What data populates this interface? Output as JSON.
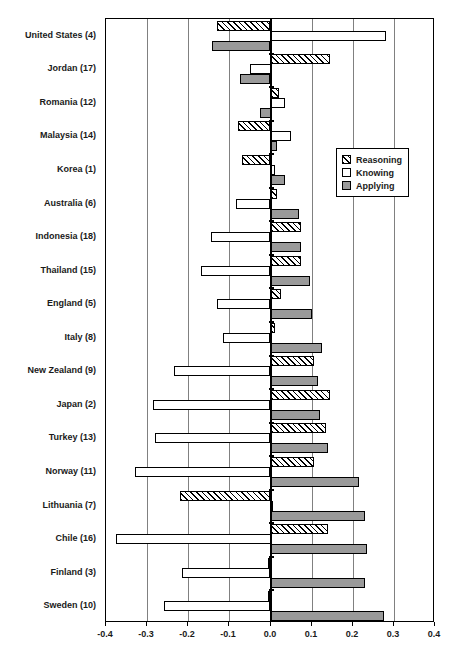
{
  "chart_data": {
    "type": "bar",
    "orientation": "horizontal",
    "title": "",
    "subtitle": "",
    "xlabel": "",
    "ylabel": "",
    "xlim": [
      -0.4,
      0.4
    ],
    "xticks": [
      -0.4,
      -0.3,
      -0.2,
      -0.1,
      0.0,
      0.1,
      0.2,
      0.3,
      0.4
    ],
    "xtick_labels": [
      "-0.4",
      "-0.3",
      "-0.2",
      "-0.1",
      "0.0",
      "0.1",
      "0.2",
      "0.3",
      "0.4"
    ],
    "grid": true,
    "grid_axis": "x",
    "legend_position": "inside-right-upper",
    "categories": [
      "United States (4)",
      "Jordan (17)",
      "Romania (12)",
      "Malaysia (14)",
      "Korea (1)",
      "Australia (6)",
      "Indonesia (18)",
      "Thailand (15)",
      "England (5)",
      "Italy (8)",
      "New Zealand (9)",
      "Japan (2)",
      "Turkey (13)",
      "Norway (11)",
      "Lithuania (7)",
      "Chile (16)",
      "Finland (3)",
      "Sweden (10)"
    ],
    "series": [
      {
        "name": "Reasoning",
        "style": "hatched",
        "color": "#ffffff",
        "values": [
          -0.13,
          0.145,
          0.02,
          -0.08,
          -0.07,
          0.015,
          0.075,
          0.075,
          0.025,
          0.01,
          0.105,
          0.145,
          0.135,
          0.105,
          -0.22,
          0.14,
          -0.005,
          -0.005
        ]
      },
      {
        "name": "Knowing",
        "style": "open",
        "color": "#ffffff",
        "values": [
          0.28,
          -0.05,
          0.035,
          0.05,
          0.01,
          -0.085,
          -0.145,
          -0.17,
          -0.13,
          -0.115,
          -0.235,
          -0.285,
          -0.28,
          -0.33,
          0.0,
          -0.375,
          -0.215,
          -0.26
        ]
      },
      {
        "name": "Applying",
        "style": "filled",
        "color": "#9a9a9a",
        "values": [
          -0.143,
          -0.073,
          -0.025,
          0.015,
          0.035,
          0.07,
          0.075,
          0.095,
          0.1,
          0.125,
          0.115,
          0.12,
          0.14,
          0.215,
          0.23,
          0.235,
          0.23,
          0.275
        ]
      }
    ]
  },
  "legend": {
    "items": [
      {
        "label": "Reasoning",
        "swatch": "hatched-swatch"
      },
      {
        "label": "Knowing",
        "swatch": "open-swatch"
      },
      {
        "label": "Applying",
        "swatch": "gray-swatch"
      }
    ]
  },
  "colors": {
    "applying_fill": "#9a9a9a",
    "gridline": "#808080",
    "axis": "#000000",
    "text": "#1a1a1a"
  }
}
